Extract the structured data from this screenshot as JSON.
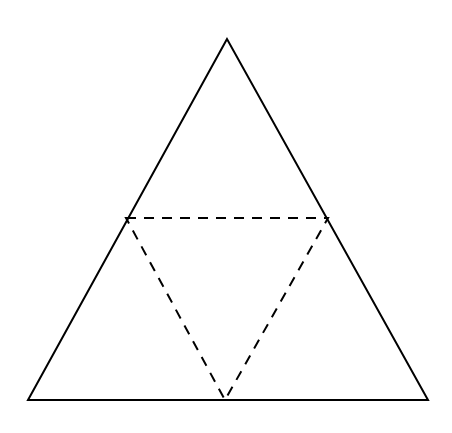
{
  "diagram": {
    "title": "",
    "outer_triangle": {
      "vertices": [
        [
          227,
          39
        ],
        [
          28,
          400
        ],
        [
          428,
          400
        ]
      ],
      "stroke": "#000000",
      "style": "solid"
    },
    "inner_triangle": {
      "vertices": [
        [
          126,
          218
        ],
        [
          328,
          218
        ],
        [
          225,
          400
        ]
      ],
      "stroke": "#000000",
      "style": "dashed"
    },
    "background": "#ffffff"
  }
}
